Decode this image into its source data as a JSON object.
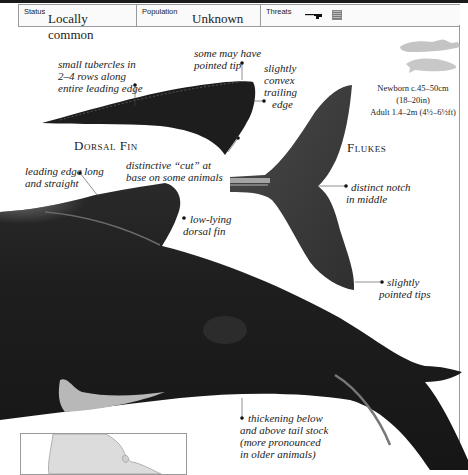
{
  "status_bar": {
    "status_label": "Status",
    "status_value": "Locally common",
    "population_label": "Population",
    "population_value": "Unknown",
    "threats_label": "Threats",
    "threat_icons": [
      "harpoon-gun-icon",
      "fishing-net-icon"
    ]
  },
  "size_info": {
    "newborn": "Newborn c.45–50cm",
    "newborn_imperial": "(18–20in)",
    "adult": "Adult 1.4–2m (4½–6½ft)"
  },
  "sections": {
    "dorsal_fin_heading": "Dorsal Fin",
    "flukes_heading": "Flukes"
  },
  "annotations": {
    "tubercles": [
      "small tubercles in",
      "2–4 rows along",
      "entire leading edge"
    ],
    "pointed_tip": [
      "some may have",
      "pointed tip"
    ],
    "trailing_edge": [
      "slightly",
      "convex",
      "trailing",
      "edge"
    ],
    "cut": [
      "distinctive “cut” at",
      "base on some animals"
    ],
    "leading_edge": [
      "leading edge long",
      "and straight"
    ],
    "low_lying": [
      "low-lying",
      "dorsal fin"
    ],
    "notch": [
      "distinct notch",
      "in middle"
    ],
    "pointed_tips": [
      "slightly",
      "pointed tips"
    ],
    "tail_stock": [
      "thickening below",
      "and above tail stock",
      "(more pronounced",
      "in older animals)"
    ]
  },
  "colors": {
    "ink": "#222222",
    "body_dark": "#1c1c1c",
    "fluke_gray": "#3e3e3e",
    "rule": "#9a9a9a",
    "map_land": "#dcdcdc"
  }
}
